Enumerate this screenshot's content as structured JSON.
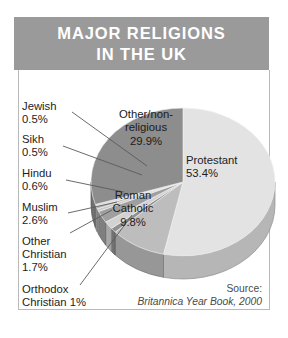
{
  "title": {
    "line1": "MAJOR RELIGIONS",
    "line2": "IN THE UK"
  },
  "source": {
    "label": "Source:",
    "citation": "Britannica Year Book, 2000"
  },
  "colors": {
    "banner": "#9a9a9a",
    "panel_border": "#b9b9b9",
    "protestant": "#e3e3e3",
    "other_non_religious": "#8d8d8d",
    "roman_catholic": "#bdbdbd",
    "sliver_light": "#d6d6d6",
    "sliver_mid": "#a8a8a8",
    "sliver_dark": "#757575",
    "text": "#1d1d1d",
    "source_text": "#4a4a4a"
  },
  "callouts": [
    {
      "name": "jewish",
      "line1": "Jewish",
      "line2": "0.5%"
    },
    {
      "name": "sikh",
      "line1": "Sikh",
      "line2": "0.5%"
    },
    {
      "name": "hindu",
      "line1": "Hindu",
      "line2": "0.6%"
    },
    {
      "name": "muslim",
      "line1": "Muslim",
      "line2": "2.6%"
    },
    {
      "name": "other-christian",
      "line1": "Other",
      "line2": "Christian",
      "line3": "1.7%"
    },
    {
      "name": "orthodox-christian",
      "line1": "Orthodox",
      "line2": "Christian 1%"
    }
  ],
  "slice_labels": [
    {
      "name": "other-non-religious",
      "line1": "Other/non-",
      "line2": "religious",
      "line3": "29.9%"
    },
    {
      "name": "protestant",
      "line1": "Protestant",
      "line2": "53.4%"
    },
    {
      "name": "roman-catholic",
      "line1": "Roman",
      "line2": "Catholic",
      "line3": "9.8%"
    }
  ],
  "chart_data": {
    "type": "pie",
    "title": "Major Religions in the UK",
    "subtitle": "",
    "xlabel": "",
    "ylabel": "",
    "units": "percent",
    "three_d": true,
    "start_angle_deg": 0,
    "direction": "clockwise",
    "legend": "none",
    "grid": false,
    "source": "Britannica Year Book, 2000",
    "categories": [
      "Protestant",
      "Roman Catholic",
      "Orthodox Christian",
      "Other Christian",
      "Muslim",
      "Hindu",
      "Sikh",
      "Jewish",
      "Other/non-religious"
    ],
    "values": [
      53.4,
      9.8,
      1.0,
      1.7,
      2.6,
      0.6,
      0.5,
      0.5,
      29.9
    ],
    "labels": [
      "Protestant 53.4%",
      "Roman Catholic 9.8%",
      "Orthodox Christian 1%",
      "Other Christian 1.7%",
      "Muslim 2.6%",
      "Hindu 0.6%",
      "Sikh 0.5%",
      "Jewish 0.5%",
      "Other/non-religious 29.9%"
    ],
    "slice_colors": [
      "#e3e3e3",
      "#bdbdbd",
      "#8f8f8f",
      "#d2d2d2",
      "#9f9f9f",
      "#c9c9c9",
      "#b0b0b0",
      "#dcdcdc",
      "#8d8d8d"
    ]
  }
}
